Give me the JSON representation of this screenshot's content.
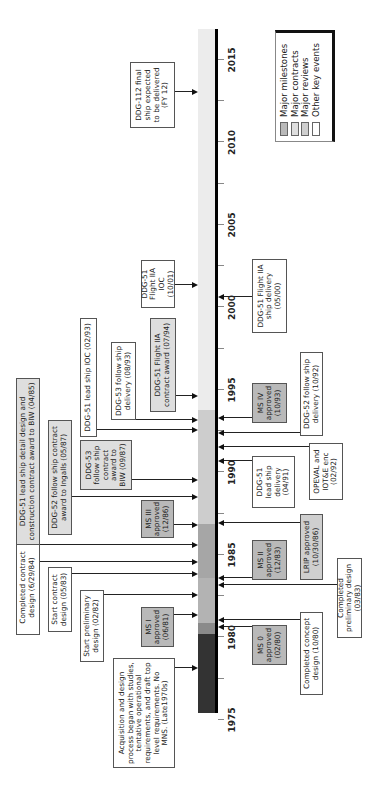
{
  "timeline": {
    "start_year": 1975.4,
    "end_year": 2016.9,
    "year_labels": [
      "1975",
      "1980",
      "1985",
      "1990",
      "1995",
      "2000",
      "2005",
      "2010",
      "2015"
    ],
    "phases": [
      {
        "name": "pre-milestone",
        "from": 1975.4,
        "to": 1980.2,
        "color": "#333333"
      },
      {
        "name": "concept",
        "from": 1980.2,
        "to": 1980.9,
        "color": "#8a8a8a"
      },
      {
        "name": "preliminary",
        "from": 1980.9,
        "to": 1983.6,
        "color": "#b3b3b3"
      },
      {
        "name": "design",
        "from": 1983.6,
        "to": 1986.9,
        "color": "#a6a6a6"
      },
      {
        "name": "production",
        "from": 1986.9,
        "to": 1993.8,
        "color": "#cdcdcd"
      },
      {
        "name": "follow-on",
        "from": 1993.8,
        "to": 2016.9,
        "color": "#ececec"
      }
    ]
  },
  "legend": {
    "items": [
      {
        "label": "Major milestones",
        "color": "#b9b9b9"
      },
      {
        "label": "Major contracts",
        "color": "#dedede"
      },
      {
        "label": "Major reviews",
        "color": "#cfcfcf"
      },
      {
        "label": "Other key events",
        "color": "#ffffff"
      }
    ]
  },
  "events_above": [
    {
      "id": "acquisition-start",
      "kind": "other",
      "date_year": 1978.1,
      "text": "Acquisition and design process began with studies, tentative operational requirements, and draft top level requirements. No MNS. (Late1970s)"
    },
    {
      "id": "start-preliminary-design",
      "kind": "other",
      "date_year": 1982.5,
      "text": "Start preliminary design (02/82)"
    },
    {
      "id": "ms-i-approved",
      "kind": "milestone",
      "date_year": 1981.6,
      "text": "MS I approved (06/81)"
    },
    {
      "id": "start-contract-design",
      "kind": "other",
      "date_year": 1983.8,
      "text": "Start contract design (05/83)"
    },
    {
      "id": "completed-contract-design",
      "kind": "other",
      "date_year": 1984.5,
      "text": "Completed contract design (6/29/84)"
    },
    {
      "id": "ddg51-lead-detail-design-contract",
      "kind": "contract",
      "date_year": 1985.3,
      "text": "DDG-51 lead ship detail design and construction contract award to BIW (04/85)"
    },
    {
      "id": "ddg52-contract-ingalls",
      "kind": "contract",
      "date_year": 1987.4,
      "text": "DDG-52 follow ship contract award to Ingalls (05/87)"
    },
    {
      "id": "ms-iii-approved",
      "kind": "milestone",
      "date_year": 1986.9,
      "text": "MS III approved (12/86)"
    },
    {
      "id": "ddg53-contract-biw",
      "kind": "contract",
      "date_year": 1987.7,
      "text": "DDG-53 follow ship contract award to BIW (09/87)"
    },
    {
      "id": "ddg51-lead-ioc",
      "kind": "other",
      "date_year": 1993.1,
      "text": "DDG-51 lead ship IOC (02/93)"
    },
    {
      "id": "ddg53-delivery",
      "kind": "other",
      "date_year": 1993.6,
      "text": "DDG-53 follow ship delivery (08/93)"
    },
    {
      "id": "ddg51-flight-iia-contract",
      "kind": "contract",
      "date_year": 1994.5,
      "text": "DDG-51 Flight IIA contract award (07/94)"
    },
    {
      "id": "ddg51-flight-iia-ioc",
      "kind": "other",
      "date_year": 2001.8,
      "text": "DDG-51 Flight IIA IOC (10/01)"
    },
    {
      "id": "ddg112-final-delivery",
      "kind": "other",
      "date_year": 2012.0,
      "text": "DDG-112 final ship expected to be delivered (FY 12)"
    }
  ],
  "events_below": [
    {
      "id": "ms-0-approved",
      "kind": "milestone",
      "date_year": 1980.1,
      "text": "MS 0 approved (02/80)"
    },
    {
      "id": "completed-concept-design",
      "kind": "other",
      "date_year": 1980.8,
      "text": "Completed concept design (10/80)"
    },
    {
      "id": "ms-ii-approved",
      "kind": "milestone",
      "date_year": 1983.9,
      "text": "MS II approved (12/83)"
    },
    {
      "id": "completed-preliminary-design",
      "kind": "other",
      "date_year": 1983.2,
      "text": "Completed preliminary design (03/83)"
    },
    {
      "id": "lrip-approved",
      "kind": "review",
      "date_year": 1986.8,
      "text": "LRIP approved (10/30/86)"
    },
    {
      "id": "ddg51-lead-delivery",
      "kind": "other",
      "date_year": 1990.3,
      "text": "DDG-51 lead ship delivery (04/91)"
    },
    {
      "id": "opeval-iote",
      "kind": "other",
      "date_year": 1991.1,
      "text": "OPEVAL and IOT&E enc (02/92)"
    },
    {
      "id": "ddg52-delivery",
      "kind": "other",
      "date_year": 1992.0,
      "text": "DDG-52 follow ship delivery (10/92)"
    },
    {
      "id": "ms-iv-approved",
      "kind": "milestone",
      "date_year": 1992.4,
      "text": "MS IV approved (10/93)"
    },
    {
      "id": "ddg51-flight-iia-delivery",
      "kind": "other",
      "date_year": 1999.6,
      "text": "DDG-51 Flight IIA ship delivery (05/00)"
    }
  ]
}
